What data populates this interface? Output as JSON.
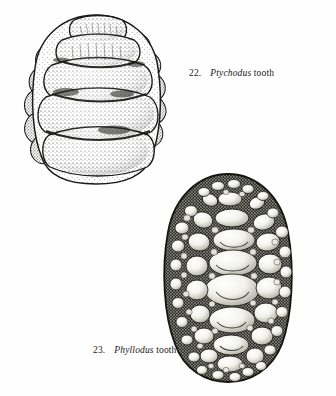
{
  "plate": {
    "title": "Fossil fish teeth illustration plate",
    "background_color": "#fefefe",
    "ink_color": "#1a1a18",
    "medium": "stippled pen-and-ink scientific illustration"
  },
  "figures": [
    {
      "number": "22.",
      "genus": "Ptychodus",
      "common": " tooth",
      "caption_full": "22.  Ptychodus tooth",
      "position": "upper-left",
      "description": "Crushing tooth crown with transverse horizontal ridges and granular marginal border",
      "width_px": 146,
      "height_px": 170
    },
    {
      "number": "23.",
      "genus": "Phyllodus",
      "common": " tooth",
      "caption_full": "23.  Phyllodus tooth",
      "position": "lower-right",
      "description": "Ovoid tooth plate paved with a mosaic of rounded denticles of graded size",
      "width_px": 126,
      "height_px": 205
    }
  ],
  "captions": {
    "fig22": {
      "num": "22.",
      "genus": "Ptychodus",
      "common": " tooth"
    },
    "fig23": {
      "num": "23.",
      "genus": "Phyllodus",
      "common": " tooth"
    }
  }
}
